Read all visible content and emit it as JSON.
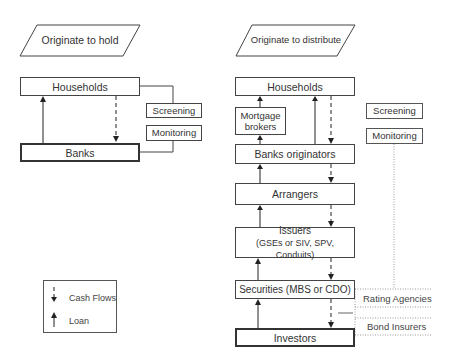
{
  "left_panel": {
    "title": "Originate to hold",
    "nodes": {
      "households": "Households",
      "banks": "Banks",
      "screening": "Screening",
      "monitoring": "Monitoring"
    }
  },
  "right_panel": {
    "title": "Originate to distribute",
    "nodes": {
      "households": "Households",
      "mortgage_brokers_1": "Mortgage",
      "mortgage_brokers_2": "brokers",
      "banks_originators": "Banks originators",
      "arrangers": "Arrangers",
      "issuers_1": "Issuers",
      "issuers_2": "(GSEs or SIV, SPV, Conduits)",
      "securities": "Securities (MBS or CDO)",
      "investors": "Investors",
      "screening": "Screening",
      "monitoring": "Monitoring",
      "rating_agencies": "Rating Agencies",
      "bond_insurers": "Bond Insurers"
    }
  },
  "legend": {
    "cash_flows": "Cash Flows",
    "loan": "Loan"
  }
}
